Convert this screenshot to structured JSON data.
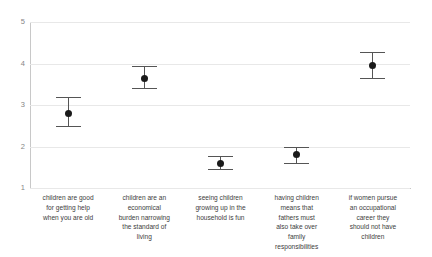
{
  "chart_data": {
    "type": "scatter",
    "title": "",
    "subtitle": "",
    "xlabel": "",
    "ylabel": "",
    "ylim": [
      1,
      5
    ],
    "yticks": [
      1,
      2,
      3,
      4,
      5
    ],
    "grid": true,
    "legend": false,
    "legend_position": "none",
    "error_bars": true,
    "categories": [
      "children are good for getting help when you are old",
      "children are an economical burden narrowing the standard of living",
      "seeing children growing up in the household is fun",
      "having children means that fathers must also take over family responsibilities",
      "if women pursue an occupational career they should not have children"
    ],
    "category_lines": [
      [
        "children are good",
        "for getting help",
        "when you are old"
      ],
      [
        "children are an",
        "economical",
        "burden narrowing",
        "the standard of",
        "living"
      ],
      [
        "seeing children",
        "growing up in the",
        "household is fun"
      ],
      [
        "having children",
        "means that",
        "fathers must",
        "also take over",
        "family",
        "responsibilities"
      ],
      [
        "if women  pursue",
        "an occupational",
        "career they",
        "should not have",
        "children"
      ]
    ],
    "values": [
      2.8,
      3.65,
      1.6,
      1.8,
      3.95
    ],
    "error_low": [
      2.5,
      3.4,
      1.45,
      1.6,
      3.65
    ],
    "error_high": [
      3.2,
      3.93,
      1.78,
      2.0,
      4.27
    ],
    "marker_color": "#1a1a1a",
    "errorbar_color": "#555555",
    "gridline_color": "#e8e8e8",
    "axis_color": "#c8c8c8"
  }
}
